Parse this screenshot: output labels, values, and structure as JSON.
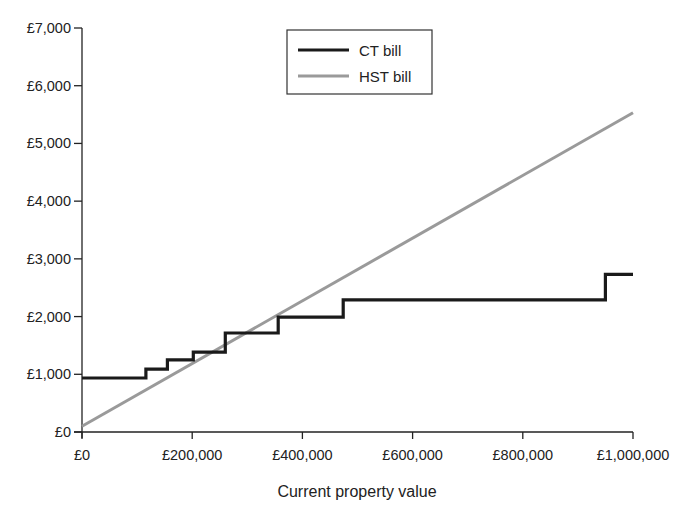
{
  "chart_data": {
    "type": "line",
    "title": "",
    "xlabel": "Current property value",
    "ylabel": "",
    "xlim": [
      0,
      1000000
    ],
    "ylim": [
      0,
      7000
    ],
    "grid": false,
    "legend_position": "upper center (inside plot)",
    "x_ticks": [
      0,
      200000,
      400000,
      600000,
      800000,
      1000000
    ],
    "x_tick_labels": [
      "£0",
      "£200,000",
      "£400,000",
      "£600,000",
      "£800,000",
      "£1,000,000"
    ],
    "y_ticks": [
      0,
      1000,
      2000,
      3000,
      4000,
      5000,
      6000,
      7000
    ],
    "y_tick_labels": [
      "£0",
      "£1,000",
      "£2,000",
      "£3,000",
      "£4,000",
      "£5,000",
      "£6,000",
      "£7,000"
    ],
    "series": [
      {
        "name": "CT bill",
        "style": "step",
        "color": "#1a1a1a",
        "x": [
          0,
          116000,
          116000,
          155000,
          155000,
          202000,
          202000,
          260000,
          260000,
          356000,
          356000,
          474000,
          474000,
          950000,
          950000,
          1000000
        ],
        "y": [
          935,
          935,
          1090,
          1090,
          1250,
          1250,
          1385,
          1385,
          1715,
          1715,
          1990,
          1990,
          2290,
          2290,
          2730,
          2730
        ]
      },
      {
        "name": "HST bill",
        "style": "linear",
        "color": "#9a9a9a",
        "x": [
          0,
          1000000
        ],
        "y": [
          100,
          5530
        ]
      }
    ]
  },
  "legend": {
    "items": [
      {
        "label": "CT bill",
        "color": "#1a1a1a"
      },
      {
        "label": "HST bill",
        "color": "#9a9a9a"
      }
    ]
  },
  "axes": {
    "x_title": "Current property value"
  }
}
